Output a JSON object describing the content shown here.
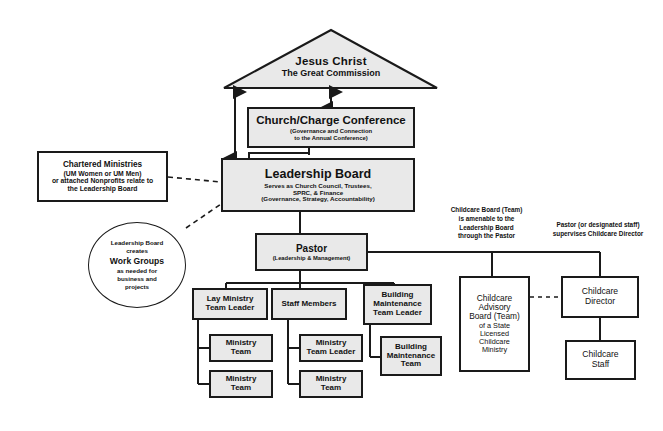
{
  "diagram": {
    "colors": {
      "box_fill": "#e9e9e9",
      "box_fill_white": "#ffffff",
      "line": "#1a1a1a",
      "background": "#ffffff"
    },
    "apex": {
      "name": "jesus-christ",
      "line1": "Jesus Christ",
      "line2": "The Great Commission"
    },
    "nodes": {
      "church_charge_conference": {
        "title": "Church/Charge Conference",
        "sub1": "(Governance and Connection",
        "sub2": "to the Annual Conference)"
      },
      "leadership_board": {
        "title": "Leadership Board",
        "sub1": "Serves as Church Council, Trustees,",
        "sub2": "SPRC, & Finance",
        "sub3": "(Governance, Strategy, Accountability)"
      },
      "chartered_ministries": {
        "line1": "Chartered Ministries",
        "line2": "(UM Women or UM Men)",
        "line3": "or attached Nonprofits relate to",
        "line4": "the Leadership Board"
      },
      "work_groups": {
        "line1": "Leadership Board",
        "line2": "creates",
        "line3": "Work Groups",
        "line4": "as needed for",
        "line5": "business and",
        "line6": "projects"
      },
      "pastor": {
        "title": "Pastor",
        "sub1": "(Leadership & Management)"
      },
      "lay_ministry_team_leader": {
        "line1": "Lay Ministry",
        "line2": "Team Leader"
      },
      "ministry_team_1": {
        "line1": "Ministry",
        "line2": "Team"
      },
      "ministry_team_2": {
        "line1": "Ministry",
        "line2": "Team"
      },
      "staff_members": {
        "line1": "Staff Members"
      },
      "ministry_team_leader": {
        "line1": "Ministry",
        "line2": "Team Leader"
      },
      "ministry_team_3": {
        "line1": "Ministry",
        "line2": "Team"
      },
      "building_maintenance_team_leader": {
        "line1": "Building",
        "line2": "Maintenance",
        "line3": "Team Leader"
      },
      "building_maintenance_team": {
        "line1": "Building",
        "line2": "Maintenance",
        "line3": "Team"
      },
      "childcare_advisory_board": {
        "line1": "Childcare",
        "line2": "Advisory",
        "line3": "Board (Team)",
        "line4": "of a State",
        "line5": "Licensed",
        "line6": "Childcare",
        "line7": "Ministry"
      },
      "childcare_director": {
        "line1": "Childcare",
        "line2": "Director"
      },
      "childcare_staff": {
        "line1": "Childcare",
        "line2": "Staff"
      }
    },
    "annotations": {
      "childcare_board_note": {
        "line1": "Childcare Board (Team)",
        "line2": "is amenable to the",
        "line3": "Leadership Board",
        "line4": "through the Pastor"
      },
      "pastor_supervises_note": {
        "line1": "Pastor (or designated staff)",
        "line2": "supervises Childcare Director"
      }
    }
  }
}
